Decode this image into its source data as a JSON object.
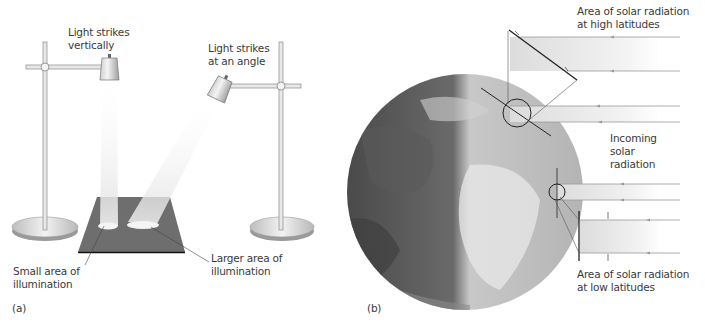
{
  "panel_a": {
    "tag": "(a)",
    "labels": {
      "vertical_line1": "Light strikes",
      "vertical_line2": "vertically",
      "angle_line1": "Light strikes",
      "angle_line2": "at an angle",
      "small_line1": "Small area of",
      "small_line2": "illumination",
      "large_line1": "Larger area of",
      "large_line2": "illumination"
    }
  },
  "panel_b": {
    "tag": "(b)",
    "labels": {
      "high_line1": "Area of solar radiation",
      "high_line2": "at high latitudes",
      "incoming_line1": "Incoming",
      "incoming_line2": "solar",
      "incoming_line3": "radiation",
      "low_line1": "Area of solar radiation",
      "low_line2": "at low latitudes"
    }
  },
  "colors": {
    "board": "#6e6e6e",
    "beam": "#e6e6e6",
    "line": "#333333",
    "ray": "#9a9a9a"
  }
}
